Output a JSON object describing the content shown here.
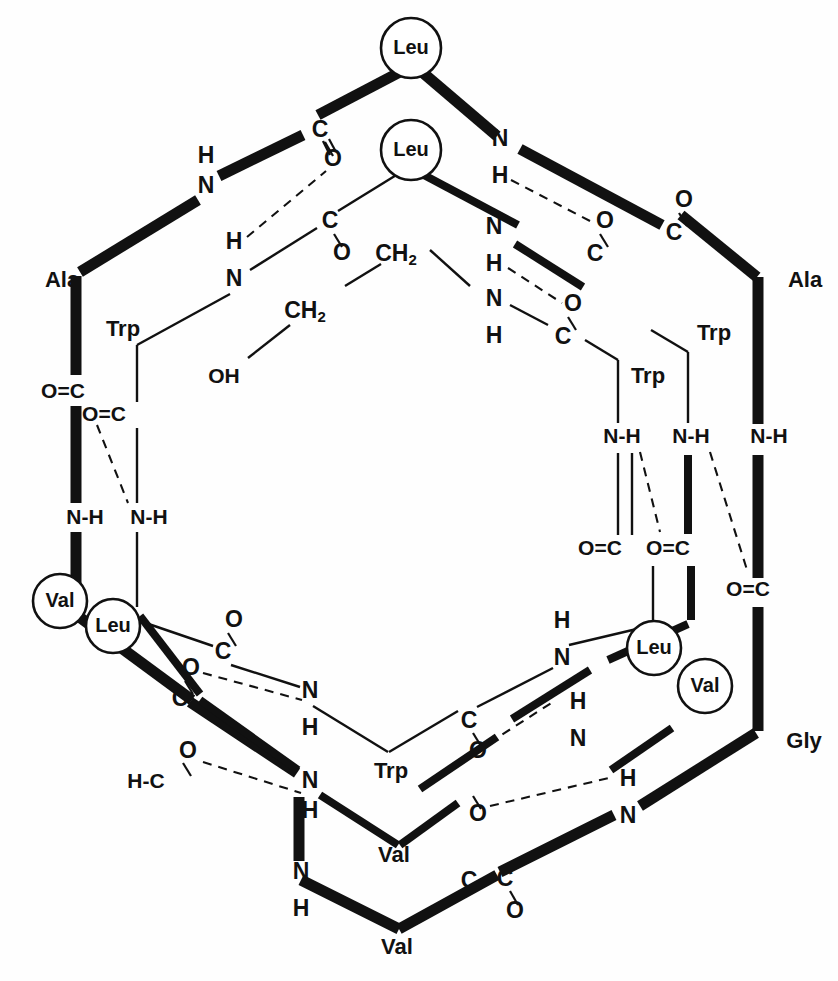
{
  "figure": {
    "type": "molecular-structure",
    "background_color": "#fefefe",
    "ink_color": "#111111"
  },
  "labels": {
    "leu": "Leu",
    "val": "Val",
    "ala": "Ala",
    "trp": "Trp",
    "gly": "Gly",
    "N": "N",
    "H": "H",
    "C": "C",
    "O": "O",
    "OH": "OH",
    "CH": "CH",
    "two": "2",
    "NH": "N-H",
    "OC": "O=C",
    "HC": "H-C"
  },
  "circled_residues": [
    {
      "id": "leu-top",
      "label": "Leu",
      "x": 411,
      "y": 48
    },
    {
      "id": "leu-upper-inner",
      "label": "Leu",
      "x": 411,
      "y": 150
    },
    {
      "id": "leu-left-lower",
      "label": "Leu",
      "x": 113,
      "y": 626
    },
    {
      "id": "leu-right-lower",
      "label": "Leu",
      "x": 654,
      "y": 648
    },
    {
      "id": "val-left",
      "label": "Val",
      "x": 60,
      "y": 601
    },
    {
      "id": "val-right",
      "label": "Val",
      "x": 705,
      "y": 686
    }
  ],
  "outer_residue_labels": [
    {
      "id": "ala-left",
      "label": "Ala",
      "x": 62,
      "y": 281
    },
    {
      "id": "ala-right",
      "label": "Ala",
      "x": 805,
      "y": 281
    },
    {
      "id": "gly-right",
      "label": "Gly",
      "x": 804,
      "y": 742
    },
    {
      "id": "val-bottom",
      "label": "Val",
      "x": 397,
      "y": 948
    }
  ],
  "inner_residue_labels": [
    {
      "id": "trp-left",
      "label": "Trp",
      "x": 123,
      "y": 330
    },
    {
      "id": "trp-right-outer",
      "label": "Trp",
      "x": 714,
      "y": 334
    },
    {
      "id": "trp-right-inner",
      "label": "Trp",
      "x": 648,
      "y": 377
    },
    {
      "id": "trp-bottom",
      "label": "Trp",
      "x": 391,
      "y": 772
    },
    {
      "id": "val-inner-bottom",
      "label": "Val",
      "x": 394,
      "y": 856
    }
  ],
  "atom_labels": [
    {
      "id": "a-n-topleft",
      "text": "N",
      "x": 206,
      "y": 187
    },
    {
      "id": "a-h-topleft",
      "text": "H",
      "x": 206,
      "y": 157
    },
    {
      "id": "a-c-topleft",
      "text": "C",
      "x": 320,
      "y": 131
    },
    {
      "id": "a-o-topleft",
      "text": "O",
      "x": 333,
      "y": 160
    },
    {
      "id": "a-h2-left",
      "text": "H",
      "x": 234,
      "y": 243
    },
    {
      "id": "a-n2-left",
      "text": "N",
      "x": 234,
      "y": 280
    },
    {
      "id": "a-c2-left",
      "text": "C",
      "x": 330,
      "y": 222
    },
    {
      "id": "a-o2-left",
      "text": "O",
      "x": 342,
      "y": 254
    },
    {
      "id": "a-ch2-upper",
      "text": "CH",
      "x": 396,
      "y": 255
    },
    {
      "id": "a-ch2-lower",
      "text": "CH",
      "x": 305,
      "y": 312
    },
    {
      "id": "a-oh",
      "text": "OH",
      "x": 224,
      "y": 377
    },
    {
      "id": "a-oc-left-out",
      "text": "O=C",
      "x": 63,
      "y": 392
    },
    {
      "id": "a-oc-left-in",
      "text": "O=C",
      "x": 104,
      "y": 415
    },
    {
      "id": "a-nh-left-out",
      "text": "N-H",
      "x": 85,
      "y": 518
    },
    {
      "id": "a-nh-left-in",
      "text": "N-H",
      "x": 149,
      "y": 518
    },
    {
      "id": "a-n-topright",
      "text": "N",
      "x": 500,
      "y": 140
    },
    {
      "id": "a-h-topright",
      "text": "H",
      "x": 500,
      "y": 177
    },
    {
      "id": "a-n3-right",
      "text": "N",
      "x": 494,
      "y": 228
    },
    {
      "id": "a-h3-right",
      "text": "H",
      "x": 494,
      "y": 265
    },
    {
      "id": "a-n4-right",
      "text": "N",
      "x": 494,
      "y": 300
    },
    {
      "id": "a-h4-right",
      "text": "H",
      "x": 494,
      "y": 337
    },
    {
      "id": "a-o-right1",
      "text": "O",
      "x": 605,
      "y": 222
    },
    {
      "id": "a-c-right1",
      "text": "C",
      "x": 595,
      "y": 255
    },
    {
      "id": "a-o-right2",
      "text": "O",
      "x": 573,
      "y": 305
    },
    {
      "id": "a-c-right2",
      "text": "C",
      "x": 563,
      "y": 338
    },
    {
      "id": "a-o-farright",
      "text": "O",
      "x": 684,
      "y": 201
    },
    {
      "id": "a-c-farright",
      "text": "C",
      "x": 674,
      "y": 234
    },
    {
      "id": "a-nh-r-in",
      "text": "N-H",
      "x": 622,
      "y": 437
    },
    {
      "id": "a-nh-r-out",
      "text": "N-H",
      "x": 691,
      "y": 437
    },
    {
      "id": "a-nh-r-far",
      "text": "N-H",
      "x": 769,
      "y": 437
    },
    {
      "id": "a-oc-r-in",
      "text": "O=C",
      "x": 600,
      "y": 549
    },
    {
      "id": "a-oc-r-out",
      "text": "O=C",
      "x": 668,
      "y": 549
    },
    {
      "id": "a-oc-r-far",
      "text": "O=C",
      "x": 748,
      "y": 590
    },
    {
      "id": "a-o-lb1",
      "text": "O",
      "x": 234,
      "y": 621
    },
    {
      "id": "a-c-lb1",
      "text": "C",
      "x": 223,
      "y": 653
    },
    {
      "id": "a-o-lb2",
      "text": "O",
      "x": 191,
      "y": 669
    },
    {
      "id": "a-c-lb2",
      "text": "C",
      "x": 180,
      "y": 700
    },
    {
      "id": "a-n-lb",
      "text": "N",
      "x": 310,
      "y": 692
    },
    {
      "id": "a-h-lb",
      "text": "H",
      "x": 310,
      "y": 729
    },
    {
      "id": "a-o-fm",
      "text": "O",
      "x": 188,
      "y": 752
    },
    {
      "id": "a-hc-fm",
      "text": "H-C",
      "x": 146,
      "y": 782
    },
    {
      "id": "a-n-fm",
      "text": "N",
      "x": 310,
      "y": 782
    },
    {
      "id": "a-h-fm",
      "text": "H",
      "x": 310,
      "y": 812
    },
    {
      "id": "a-n-bl",
      "text": "N",
      "x": 301,
      "y": 873
    },
    {
      "id": "a-h-bl",
      "text": "H",
      "x": 301,
      "y": 910
    },
    {
      "id": "a-h-rb1",
      "text": "H",
      "x": 562,
      "y": 622
    },
    {
      "id": "a-n-rb1",
      "text": "N",
      "x": 562,
      "y": 659
    },
    {
      "id": "a-c-rb1",
      "text": "C",
      "x": 469,
      "y": 882
    },
    {
      "id": "a-o-rb1",
      "text": "O",
      "x": 478,
      "y": 752
    },
    {
      "id": "a-c-rb2",
      "text": "C",
      "x": 469,
      "y": 722
    },
    {
      "id": "a-h-rb2",
      "text": "H",
      "x": 578,
      "y": 703
    },
    {
      "id": "a-n-rb2",
      "text": "N",
      "x": 578,
      "y": 740
    },
    {
      "id": "a-o-rb2",
      "text": "O",
      "x": 478,
      "y": 815
    },
    {
      "id": "a-h-rb3",
      "text": "H",
      "x": 628,
      "y": 780
    },
    {
      "id": "a-n-rb3",
      "text": "N",
      "x": 628,
      "y": 817
    },
    {
      "id": "a-c-bottom",
      "text": "C",
      "x": 505,
      "y": 880
    },
    {
      "id": "a-o-bottom",
      "text": "O",
      "x": 515,
      "y": 912
    }
  ],
  "counts": {
    "circled_residues": 6,
    "hydrogen_bonds": 12
  }
}
